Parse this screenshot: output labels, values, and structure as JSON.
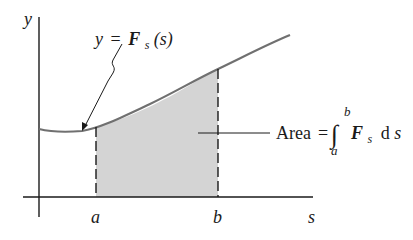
{
  "figure": {
    "axes": {
      "y_label": "y",
      "x_label": "s"
    },
    "curve": {
      "label_lhs": "y",
      "label_eq": "=",
      "label_func": "F",
      "label_sub": "s",
      "label_arg": "(s)"
    },
    "bounds": {
      "lower": "a",
      "upper": "b"
    },
    "area_annotation": {
      "word": "Area",
      "eq": "=",
      "integral_sign": "∫",
      "upper_limit": "b",
      "lower_limit": "a",
      "integrand": "F",
      "integrand_sub": "s",
      "differential_d": "d",
      "differential_var": "s"
    },
    "colors": {
      "curve": "#707070",
      "shade": "#d4d4d4",
      "ink": "#1a1a1a",
      "background": "#ffffff"
    }
  }
}
